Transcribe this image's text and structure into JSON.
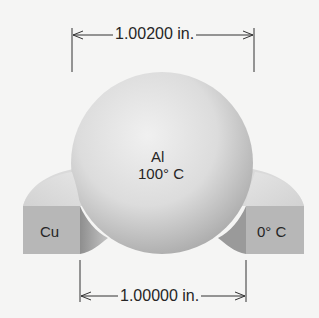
{
  "diagram": {
    "top_dimension": "1.00200 in.",
    "bottom_dimension": "1.00000 in.",
    "sphere": {
      "material": "Al",
      "temperature": "100° C"
    },
    "ring": {
      "material_label": "Cu",
      "temperature_label": "0° C"
    }
  },
  "colors": {
    "background": "#f5f5f4",
    "sphere_light": "#ededed",
    "sphere_dark": "#a9a9a9",
    "ring_face": "#b5b5b5",
    "ring_top": "#d6d6d6",
    "line": "#333333"
  }
}
